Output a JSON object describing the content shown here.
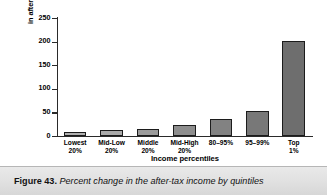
{
  "figure": {
    "caption_label": "Figure 43.",
    "caption_body": "Percent change in the after-tax income by quintiles"
  },
  "chart_data": {
    "type": "bar",
    "title": "",
    "xlabel": "Income percentiles",
    "ylabel": "Percent change in after-tax income, 1979–2000",
    "ylabel_lines": [
      "Percent change",
      "in after-tax income, 1979–2000"
    ],
    "categories": [
      "Lowest 20%",
      "Mid-Low 20%",
      "Middle 20%",
      "Mid-High 20%",
      "80–95%",
      "95–99%",
      "Top 1%"
    ],
    "category_lines": [
      [
        "Lowest",
        "20%"
      ],
      [
        "Mid-Low",
        "20%"
      ],
      [
        "Middle",
        "20%"
      ],
      [
        "Mid-High",
        "20%"
      ],
      [
        "80–95%",
        ""
      ],
      [
        "95–99%",
        ""
      ],
      [
        "Top",
        "1%"
      ]
    ],
    "values": [
      8,
      12,
      15,
      23,
      35,
      52,
      201
    ],
    "bar_colors": [
      "#b0b0b0",
      "#aaaaaa",
      "#9b9b9b",
      "#8e8e8e",
      "#828282",
      "#787878",
      "#6e6e6e"
    ],
    "bar_border_color": "#1c1c1c",
    "ylim": [
      0,
      250
    ],
    "yticks": [
      0,
      50,
      100,
      150,
      200,
      250
    ],
    "ytick_labels": [
      "0",
      "50",
      "100",
      "150",
      "200",
      "250"
    ],
    "grid": false,
    "legend": "none",
    "axis_color": "#2a2a2a",
    "background": "#ffffff"
  }
}
